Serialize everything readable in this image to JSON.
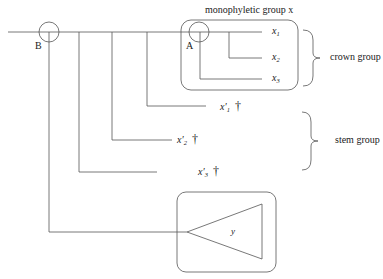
{
  "diagram": {
    "title": "monophyletic group x",
    "title_var": "x",
    "nodes": {
      "B": {
        "label": "B"
      },
      "A": {
        "label": "A"
      }
    },
    "crown_taxa": [
      {
        "base": "x",
        "sub": "1"
      },
      {
        "base": "x",
        "sub": "2"
      },
      {
        "base": "x",
        "sub": "3"
      }
    ],
    "stem_taxa": [
      {
        "base": "x′",
        "sub": "1",
        "extinct_symbol": "†"
      },
      {
        "base": "x′",
        "sub": "2",
        "extinct_symbol": "†"
      },
      {
        "base": "x′",
        "sub": "3",
        "extinct_symbol": "†"
      }
    ],
    "outgroup": {
      "label": "y"
    },
    "brackets": {
      "crown": "crown group",
      "stem": "stem group"
    }
  }
}
